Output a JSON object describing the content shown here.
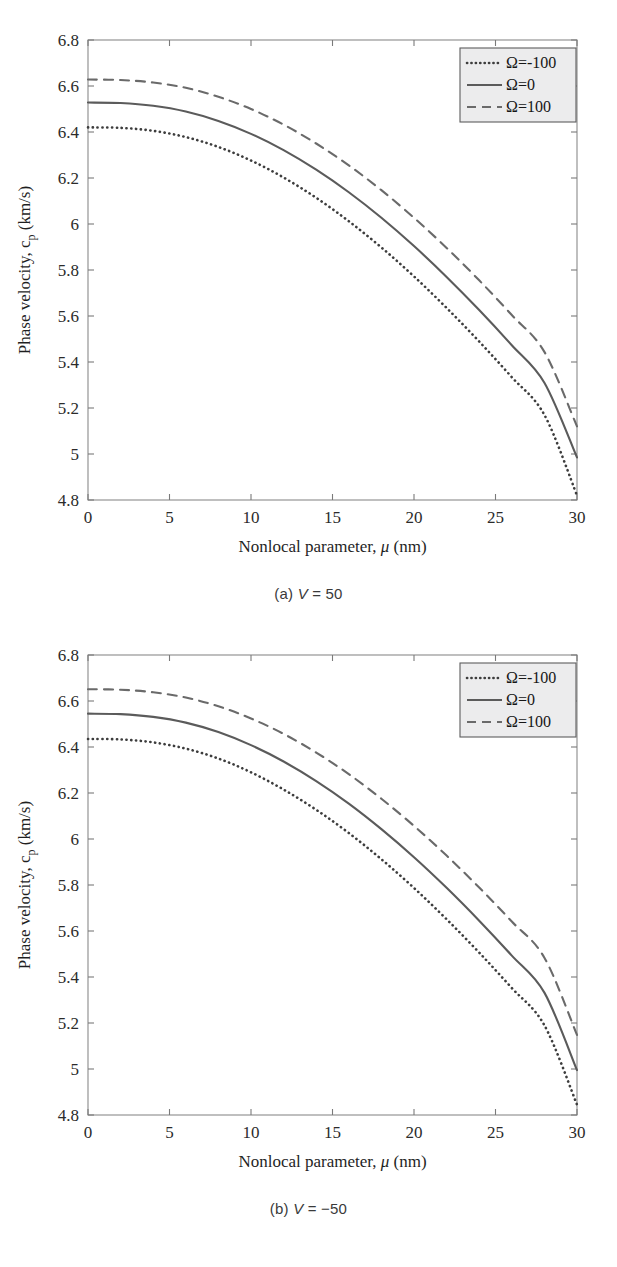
{
  "figure": {
    "panels": [
      {
        "id": "panel-a",
        "caption_prefix": "(a) ",
        "caption_var": "V",
        "caption_rest": " = 50",
        "caption_full": "(a) V = 50"
      },
      {
        "id": "panel-b",
        "caption_prefix": "(b) ",
        "caption_var": "V",
        "caption_rest": " = −50",
        "caption_full": "(b) V = −50"
      }
    ]
  },
  "chart_data": [
    {
      "type": "line",
      "title": "",
      "panel_label": "(a) V = 50",
      "xlabel": "Nonlocal parameter, μ (nm)",
      "ylabel": "Phase velocity, c_p (km/s)",
      "ylabel_main": "Phase velocity, c",
      "ylabel_sub": "p",
      "ylabel_unit": " (km/s)",
      "xlim": [
        0,
        30
      ],
      "ylim": [
        4.8,
        6.8
      ],
      "xticks": [
        0,
        5,
        10,
        15,
        20,
        25,
        30
      ],
      "xtick_labels": [
        "0",
        "5",
        "10",
        "15",
        "20",
        "25",
        "30"
      ],
      "yticks": [
        4.8,
        5.0,
        5.2,
        5.4,
        5.6,
        5.8,
        6.0,
        6.2,
        6.4,
        6.6,
        6.8
      ],
      "ytick_labels": [
        "4.8",
        "5",
        "5.2",
        "5.4",
        "5.6",
        "5.8",
        "6",
        "6.2",
        "6.4",
        "6.6",
        "6.8"
      ],
      "grid": false,
      "legend_position": "top-right",
      "x": [
        0,
        2,
        4,
        6,
        8,
        10,
        12,
        14,
        16,
        18,
        20,
        22,
        24,
        26,
        28,
        30
      ],
      "series": [
        {
          "name": "Ω=-100",
          "style": "dotted",
          "color": "#3d3d3d",
          "values": [
            6.42,
            6.418,
            6.405,
            6.378,
            6.335,
            6.276,
            6.202,
            6.114,
            6.012,
            5.898,
            5.772,
            5.635,
            5.489,
            5.334,
            5.17,
            4.82
          ]
        },
        {
          "name": "Ω=0",
          "style": "solid",
          "color": "#5b5b5b",
          "values": [
            6.528,
            6.526,
            6.514,
            6.489,
            6.448,
            6.392,
            6.321,
            6.236,
            6.138,
            6.027,
            5.904,
            5.77,
            5.626,
            5.473,
            5.31,
            4.985
          ]
        },
        {
          "name": "Ω=100",
          "style": "dashed",
          "color": "#6a6a6a",
          "values": [
            6.628,
            6.626,
            6.615,
            6.592,
            6.553,
            6.5,
            6.432,
            6.35,
            6.255,
            6.147,
            6.027,
            5.896,
            5.755,
            5.604,
            5.444,
            5.12
          ]
        }
      ],
      "legend": [
        {
          "label": "Ω=-100",
          "style": "dotted"
        },
        {
          "label": "Ω=0",
          "style": "solid"
        },
        {
          "label": "Ω=100",
          "style": "dashed"
        }
      ]
    },
    {
      "type": "line",
      "title": "",
      "panel_label": "(b) V = −50",
      "xlabel": "Nonlocal parameter, μ (nm)",
      "ylabel": "Phase velocity, c_p (km/s)",
      "ylabel_main": "Phase velocity, c",
      "ylabel_sub": "p",
      "ylabel_unit": " (km/s)",
      "xlim": [
        0,
        30
      ],
      "ylim": [
        4.8,
        6.8
      ],
      "xticks": [
        0,
        5,
        10,
        15,
        20,
        25,
        30
      ],
      "xtick_labels": [
        "0",
        "5",
        "10",
        "15",
        "20",
        "25",
        "30"
      ],
      "yticks": [
        4.8,
        5.0,
        5.2,
        5.4,
        5.6,
        5.8,
        6.0,
        6.2,
        6.4,
        6.6,
        6.8
      ],
      "ytick_labels": [
        "4.8",
        "5",
        "5.2",
        "5.4",
        "5.6",
        "5.8",
        "6",
        "6.2",
        "6.4",
        "6.6",
        "6.8"
      ],
      "grid": false,
      "legend_position": "top-right",
      "x": [
        0,
        2,
        4,
        6,
        8,
        10,
        12,
        14,
        16,
        18,
        20,
        22,
        24,
        26,
        28,
        30
      ],
      "series": [
        {
          "name": "Ω=-100",
          "style": "dotted",
          "color": "#3d3d3d",
          "values": [
            6.435,
            6.433,
            6.42,
            6.393,
            6.35,
            6.29,
            6.215,
            6.127,
            6.026,
            5.912,
            5.787,
            5.651,
            5.506,
            5.352,
            5.19,
            4.845
          ]
        },
        {
          "name": "Ω=0",
          "style": "solid",
          "color": "#5b5b5b",
          "values": [
            6.545,
            6.543,
            6.531,
            6.506,
            6.465,
            6.408,
            6.337,
            6.252,
            6.154,
            6.043,
            5.921,
            5.788,
            5.645,
            5.493,
            5.332,
            4.995
          ]
        },
        {
          "name": "Ω=100",
          "style": "dashed",
          "color": "#6a6a6a",
          "values": [
            6.651,
            6.649,
            6.638,
            6.615,
            6.577,
            6.524,
            6.457,
            6.376,
            6.282,
            6.175,
            6.057,
            5.928,
            5.789,
            5.641,
            5.484,
            5.148
          ]
        }
      ],
      "legend": [
        {
          "label": "Ω=-100",
          "style": "dotted"
        },
        {
          "label": "Ω=0",
          "style": "solid"
        },
        {
          "label": "Ω=100",
          "style": "dashed"
        }
      ]
    }
  ]
}
